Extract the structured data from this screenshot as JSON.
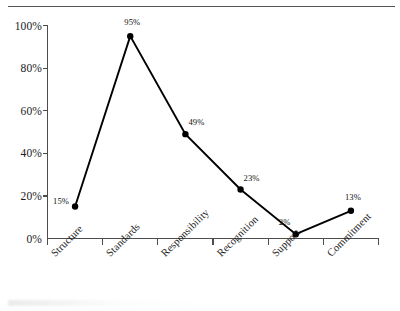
{
  "chart_data": {
    "type": "line",
    "title": "",
    "subtitle": "",
    "xlabel": "",
    "ylabel": "",
    "categories": [
      "Structure",
      "Standards",
      "Responsibility",
      "Recognition",
      "Support",
      "Commitment"
    ],
    "values": [
      15,
      95,
      49,
      23,
      2,
      13
    ],
    "point_labels": [
      "15%",
      "95%",
      "49%",
      "23%",
      "2%",
      "13%"
    ],
    "series": [
      {
        "name": "",
        "values": [
          15,
          95,
          49,
          23,
          2,
          13
        ]
      }
    ],
    "ylim": [
      0,
      100
    ],
    "yticks": [
      0,
      20,
      40,
      60,
      80,
      100
    ],
    "ytick_labels": [
      "0%",
      "20%",
      "40%",
      "60%",
      "80%",
      "100%"
    ],
    "grid": false,
    "legend": "none",
    "marker": "filled-circle",
    "line_color": "#000000",
    "marker_color": "#000000",
    "axis_color": "#4d4d4d",
    "background_color": "#ffffff",
    "label_rotation_degrees": -45
  },
  "decorations": {
    "top_rule_present": true
  }
}
